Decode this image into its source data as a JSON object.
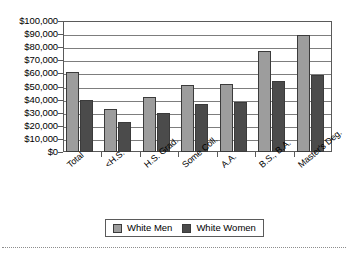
{
  "chart_data": {
    "type": "bar",
    "title": "",
    "subtitle": "",
    "xlabel": "",
    "ylabel": "",
    "ylim": [
      0,
      100000
    ],
    "ytick_step": 10000,
    "ytick_labels": [
      "$100,000",
      "$90,000",
      "$80,000",
      "$70,000",
      "$60,000",
      "$50,000",
      "$40,000",
      "$30,000",
      "$20,000",
      "$10,000",
      "$0"
    ],
    "ytick_values": [
      100000,
      90000,
      80000,
      70000,
      60000,
      50000,
      40000,
      30000,
      20000,
      10000,
      0
    ],
    "grid": true,
    "grid_axis": "y",
    "legend_position": "bottom",
    "categories": [
      "Total",
      "<H.S.",
      "H.S. Grad.",
      "Some Coll.",
      "A.A.",
      "B.S., B.A.",
      "Master's Deg."
    ],
    "series": [
      {
        "name": "White Men",
        "color": "#9d9d9d",
        "values": [
          61000,
          32500,
          42000,
          51000,
          52000,
          77000,
          89000
        ]
      },
      {
        "name": "White Women",
        "color": "#4b4b4b",
        "values": [
          40000,
          23000,
          30000,
          37000,
          38000,
          54000,
          59000
        ]
      }
    ]
  },
  "legend": {
    "entries": [
      {
        "label": "White Men"
      },
      {
        "label": "White Women"
      }
    ]
  },
  "colors": {
    "series_men": "#9d9d9d",
    "series_women": "#4b4b4b",
    "axis": "#5a5a5a",
    "gridline": "#7d7d7d",
    "background": "#ffffff"
  }
}
